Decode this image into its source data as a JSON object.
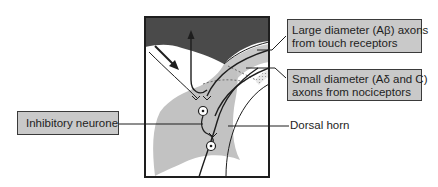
{
  "diagram": {
    "title": "",
    "labels": {
      "large_axons": {
        "line1": "Large diameter (Aβ) axons",
        "line2": "from touch receptors"
      },
      "small_axons": {
        "line1": "Small diameter (Aδ and C)",
        "line2": "axons from nociceptors"
      },
      "inhibitory_neurone": "Inhibitory neurone",
      "dorsal_horn": "Dorsal horn"
    },
    "colors": {
      "dark_region": "#4a4a4a",
      "grey_region": "#c2c2c2",
      "label_fill": "#c9c9c9",
      "line": "#1e1e1e",
      "background": "#ffffff"
    }
  }
}
